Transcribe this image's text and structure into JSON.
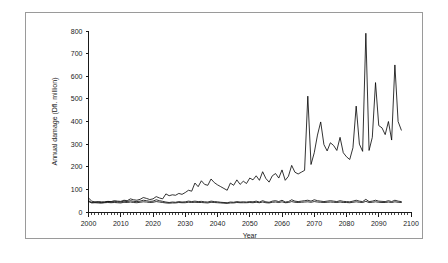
{
  "chart_data": {
    "type": "line",
    "title": "",
    "xlabel": "Year",
    "ylabel": "Annual damage (Dfl. million)",
    "xlim": [
      2000,
      2100
    ],
    "ylim": [
      0,
      800
    ],
    "ytick_labels": [
      "0",
      "100",
      "200",
      "300",
      "400",
      "500",
      "600",
      "700",
      "800"
    ],
    "ytick_values": [
      0,
      100,
      200,
      300,
      400,
      500,
      600,
      700,
      800
    ],
    "xtick_labels": [
      "2000",
      "2010",
      "2020",
      "2030",
      "2040",
      "2050",
      "2060",
      "2070",
      "2080",
      "2090",
      "2100"
    ],
    "xtick_values": [
      2000,
      2010,
      2020,
      2030,
      2040,
      2050,
      2060,
      2070,
      2080,
      2090,
      2100
    ],
    "minor_xtick_interval": 1,
    "grid": false,
    "legend": "none",
    "line_color": "#000000",
    "background_color": "#ffffff",
    "x": [
      2000,
      2001,
      2002,
      2003,
      2004,
      2005,
      2006,
      2007,
      2008,
      2009,
      2010,
      2011,
      2012,
      2013,
      2014,
      2015,
      2016,
      2017,
      2018,
      2019,
      2020,
      2021,
      2022,
      2023,
      2024,
      2025,
      2026,
      2027,
      2028,
      2029,
      2030,
      2031,
      2032,
      2033,
      2034,
      2035,
      2036,
      2037,
      2038,
      2039,
      2040,
      2041,
      2042,
      2043,
      2044,
      2045,
      2046,
      2047,
      2048,
      2049,
      2050,
      2051,
      2052,
      2053,
      2054,
      2055,
      2056,
      2057,
      2058,
      2059,
      2060,
      2061,
      2062,
      2063,
      2064,
      2065,
      2066,
      2067,
      2068,
      2069,
      2070,
      2071,
      2072,
      2073,
      2074,
      2075,
      2076,
      2077,
      2078,
      2079,
      2080,
      2081,
      2082,
      2083,
      2084,
      2085,
      2086,
      2087,
      2088,
      2089,
      2090,
      2091,
      2092,
      2093,
      2094,
      2095,
      2096,
      2097
    ],
    "series": [
      {
        "name": "rising-damage-series",
        "values": [
          62,
          48,
          44,
          46,
          45,
          44,
          47,
          46,
          50,
          48,
          47,
          52,
          50,
          58,
          54,
          52,
          56,
          64,
          60,
          55,
          58,
          68,
          62,
          58,
          80,
          72,
          76,
          74,
          82,
          78,
          86,
          96,
          92,
          128,
          112,
          138,
          122,
          118,
          146,
          130,
          120,
          112,
          104,
          96,
          128,
          118,
          142,
          122,
          136,
          126,
          150,
          142,
          160,
          140,
          178,
          148,
          132,
          160,
          170,
          150,
          186,
          140,
          158,
          206,
          176,
          168,
          176,
          184,
          512,
          210,
          262,
          340,
          398,
          298,
          270,
          306,
          294,
          272,
          330,
          262,
          244,
          232,
          284,
          468,
          300,
          268,
          790,
          272,
          330,
          572,
          382,
          372,
          342,
          400,
          318,
          650,
          400,
          362
        ]
      },
      {
        "name": "flat-series-upper",
        "values": [
          50,
          42,
          44,
          43,
          42,
          44,
          46,
          44,
          46,
          45,
          44,
          48,
          46,
          50,
          47,
          46,
          48,
          52,
          50,
          47,
          48,
          54,
          50,
          47,
          44,
          42,
          44,
          43,
          46,
          44,
          45,
          48,
          46,
          48,
          46,
          47,
          45,
          44,
          48,
          46,
          45,
          43,
          42,
          41,
          44,
          43,
          46,
          44,
          45,
          44,
          46,
          45,
          48,
          44,
          50,
          45,
          43,
          48,
          50,
          46,
          52,
          44,
          46,
          54,
          48,
          46,
          48,
          50,
          52,
          48,
          54,
          50,
          48,
          46,
          48,
          50,
          48,
          46,
          50,
          47,
          46,
          45,
          48,
          52,
          48,
          46,
          56,
          46,
          48,
          52,
          48,
          47,
          46,
          50,
          46,
          52,
          48,
          46
        ]
      },
      {
        "name": "flat-series-lower",
        "values": [
          46,
          40,
          41,
          40,
          39,
          41,
          42,
          41,
          42,
          41,
          40,
          43,
          42,
          44,
          42,
          41,
          43,
          45,
          44,
          42,
          43,
          46,
          44,
          42,
          40,
          39,
          40,
          40,
          42,
          41,
          41,
          43,
          42,
          43,
          42,
          42,
          41,
          40,
          43,
          42,
          41,
          40,
          39,
          38,
          40,
          40,
          42,
          41,
          41,
          41,
          42,
          41,
          43,
          41,
          44,
          41,
          40,
          43,
          44,
          42,
          45,
          41,
          42,
          46,
          43,
          42,
          43,
          44,
          45,
          43,
          46,
          44,
          43,
          42,
          43,
          44,
          43,
          42,
          44,
          42,
          42,
          41,
          43,
          45,
          43,
          42,
          47,
          42,
          43,
          45,
          43,
          42,
          42,
          44,
          42,
          45,
          43,
          42
        ]
      }
    ]
  }
}
